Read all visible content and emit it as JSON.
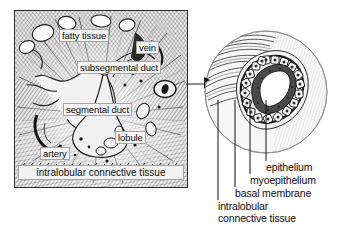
{
  "figure": {
    "style": "grayscale engraving / line-hatched anatomical illustration"
  },
  "left_panel": {
    "name": "tissue-overview-panel",
    "caption": "intralobular connective tissue",
    "labels": [
      {
        "id": "fatty-tissue",
        "text": "fatty tissue",
        "x": 44,
        "y": 18
      },
      {
        "id": "vein",
        "text": "vein",
        "x": 121,
        "y": 30
      },
      {
        "id": "subsegmental-duct",
        "text": "subsegmental duct",
        "x": 62,
        "y": 50
      },
      {
        "id": "segmental-duct",
        "text": "segmental duct",
        "x": 48,
        "y": 92
      },
      {
        "id": "lobule",
        "text": "lobule",
        "x": 100,
        "y": 120
      },
      {
        "id": "artery",
        "text": "artery",
        "x": 25,
        "y": 136
      }
    ]
  },
  "connector": {
    "name": "magnification-arrow",
    "direction": "left-to-right",
    "meaning": "duct shown magnified in circular inset"
  },
  "inset": {
    "name": "duct-cross-section-inset",
    "shape": "circle",
    "contents": "duct lumen lined by epithelium, myoepithelium and basal membrane, surrounded by connective tissue"
  },
  "inset_labels": [
    {
      "id": "epithelium",
      "text": "epithelium"
    },
    {
      "id": "myoepithelium",
      "text": "myoepithelium"
    },
    {
      "id": "basal-membrane",
      "text": "basal membrane"
    },
    {
      "id": "intralobular-line1",
      "text": "intralobular"
    },
    {
      "id": "intralobular-line2",
      "text": "connective tissue"
    }
  ],
  "colors": {
    "background": "#ffffff",
    "ink": "#111111",
    "panel_fill": "#efefef",
    "label_fill": "#f4f4f4",
    "border": "#2b2b2b"
  }
}
